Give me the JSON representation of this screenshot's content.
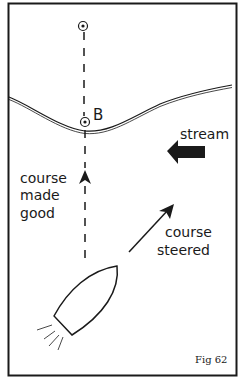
{
  "figure": {
    "caption": "Fig 62",
    "labels": {
      "point": "B",
      "stream": "stream",
      "course_made_good": [
        "course",
        "made",
        "good"
      ],
      "course_steered": [
        "course",
        "steered"
      ]
    }
  },
  "colors": {
    "ink": "#1a1a1a",
    "background": "#ffffff"
  }
}
